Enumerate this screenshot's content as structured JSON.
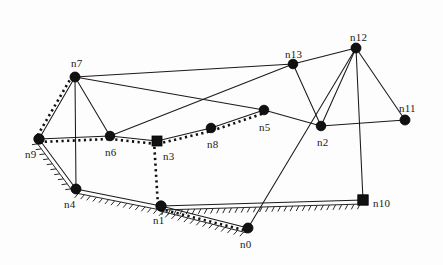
{
  "diagram": {
    "background_color": "#fdfdfd",
    "node_color": "#111111",
    "edge_color": "#1a1a1a",
    "width": 443,
    "height": 265
  },
  "nodes": [
    {
      "id": "n0",
      "label": "n0",
      "x": 248,
      "y": 228,
      "shape": "circle",
      "r": 5.0,
      "label_dx": -8,
      "label_dy": 11
    },
    {
      "id": "n1",
      "label": "n1",
      "x": 161,
      "y": 206,
      "shape": "circle",
      "r": 5.2,
      "label_dx": -8,
      "label_dy": 9
    },
    {
      "id": "n2",
      "label": "n2",
      "x": 321,
      "y": 126,
      "shape": "circle",
      "r": 4.8,
      "label_dx": -4,
      "label_dy": 11
    },
    {
      "id": "n3",
      "label": "n3",
      "x": 157,
      "y": 141,
      "shape": "square",
      "r": 5.0,
      "label_dx": 6,
      "label_dy": 10
    },
    {
      "id": "n4",
      "label": "n4",
      "x": 76,
      "y": 189,
      "shape": "circle",
      "r": 5.0,
      "label_dx": -12,
      "label_dy": 10
    },
    {
      "id": "n5",
      "label": "n5",
      "x": 264,
      "y": 110,
      "shape": "circle",
      "r": 4.8,
      "label_dx": -5,
      "label_dy": 12
    },
    {
      "id": "n6",
      "label": "n6",
      "x": 110,
      "y": 136,
      "shape": "circle",
      "r": 4.8,
      "label_dx": -5,
      "label_dy": 11
    },
    {
      "id": "n7",
      "label": "n7",
      "x": 75,
      "y": 77,
      "shape": "circle",
      "r": 5.0,
      "label_dx": -4,
      "label_dy": -19
    },
    {
      "id": "n8",
      "label": "n8",
      "x": 211,
      "y": 128,
      "shape": "circle",
      "r": 4.8,
      "label_dx": -4,
      "label_dy": 11
    },
    {
      "id": "n9",
      "label": "n9",
      "x": 39,
      "y": 139,
      "shape": "circle",
      "r": 5.2,
      "label_dx": -14,
      "label_dy": 10
    },
    {
      "id": "n10",
      "label": "n10",
      "x": 363,
      "y": 200,
      "shape": "square",
      "r": 5.2,
      "label_dx": 10,
      "label_dy": -2
    },
    {
      "id": "n11",
      "label": "n11",
      "x": 405,
      "y": 120,
      "shape": "circle",
      "r": 5.0,
      "label_dx": -6,
      "label_dy": -17
    },
    {
      "id": "n12",
      "label": "n12",
      "x": 356,
      "y": 48,
      "shape": "circle",
      "r": 5.0,
      "label_dx": -6,
      "label_dy": -16
    },
    {
      "id": "n13",
      "label": "n13",
      "x": 293,
      "y": 64,
      "shape": "circle",
      "r": 4.8,
      "label_dx": -8,
      "label_dy": -15
    }
  ],
  "edges": [
    {
      "from": "n7",
      "to": "n9",
      "style": "solid"
    },
    {
      "from": "n7",
      "to": "n6",
      "style": "solid"
    },
    {
      "from": "n7",
      "to": "n13",
      "style": "solid"
    },
    {
      "from": "n7",
      "to": "n5",
      "style": "solid"
    },
    {
      "from": "n9",
      "to": "n6",
      "style": "solid"
    },
    {
      "from": "n9",
      "to": "n4",
      "style": "solid"
    },
    {
      "from": "n6",
      "to": "n3",
      "style": "solid"
    },
    {
      "from": "n6",
      "to": "n13",
      "style": "solid"
    },
    {
      "from": "n3",
      "to": "n8",
      "style": "solid"
    },
    {
      "from": "n8",
      "to": "n5",
      "style": "solid"
    },
    {
      "from": "n5",
      "to": "n2",
      "style": "solid"
    },
    {
      "from": "n2",
      "to": "n11",
      "style": "solid"
    },
    {
      "from": "n2",
      "to": "n13",
      "style": "solid"
    },
    {
      "from": "n2",
      "to": "n12",
      "style": "solid"
    },
    {
      "from": "n12",
      "to": "n13",
      "style": "solid"
    },
    {
      "from": "n12",
      "to": "n11",
      "style": "solid"
    },
    {
      "from": "n12",
      "to": "n10",
      "style": "solid"
    },
    {
      "from": "n12",
      "to": "n0",
      "style": "solid"
    },
    {
      "from": "n4",
      "to": "n1",
      "style": "solid"
    },
    {
      "from": "n1",
      "to": "n10",
      "style": "solid"
    },
    {
      "from": "n1",
      "to": "n0",
      "style": "solid"
    },
    {
      "from": "n4",
      "to": "n7",
      "style": "solid"
    }
  ],
  "overlay_paths": [
    {
      "name": "dotted-path-a",
      "style": "dotted",
      "nodes": [
        "n7",
        "n9",
        "n6",
        "n3",
        "n8",
        "n5"
      ],
      "offset": 3
    },
    {
      "name": "dotted-path-b",
      "style": "dotted",
      "nodes": [
        "n3",
        "n1",
        "n0"
      ],
      "offset": 3
    },
    {
      "name": "hatched-path-a",
      "style": "hatched",
      "nodes": [
        "n9",
        "n4",
        "n1",
        "n10"
      ],
      "offset": 4
    },
    {
      "name": "hatched-path-b",
      "style": "hatched",
      "nodes": [
        "n1",
        "n0"
      ],
      "offset": 5
    }
  ],
  "chart_data": {
    "type": "diagram",
    "subtype": "node-link-graph",
    "node_count": 14,
    "edge_count": 22,
    "node_labels": [
      "n0",
      "n1",
      "n2",
      "n3",
      "n4",
      "n5",
      "n6",
      "n7",
      "n8",
      "n9",
      "n10",
      "n11",
      "n12",
      "n13"
    ],
    "square_nodes": [
      "n3",
      "n10"
    ],
    "edge_list": [
      "n7-n9",
      "n7-n6",
      "n7-n13",
      "n7-n5",
      "n9-n6",
      "n9-n4",
      "n6-n3",
      "n6-n13",
      "n3-n8",
      "n8-n5",
      "n5-n2",
      "n2-n11",
      "n2-n13",
      "n2-n12",
      "n12-n13",
      "n12-n11",
      "n12-n10",
      "n12-n0",
      "n4-n1",
      "n1-n10",
      "n1-n0",
      "n4-n7"
    ],
    "highlighted_paths": [
      {
        "name": "dotted",
        "nodes": [
          "n7",
          "n9",
          "n6",
          "n3",
          "n8",
          "n5"
        ]
      },
      {
        "name": "dotted",
        "nodes": [
          "n3",
          "n1",
          "n0"
        ]
      },
      {
        "name": "hatched",
        "nodes": [
          "n9",
          "n4",
          "n1",
          "n10"
        ]
      },
      {
        "name": "hatched",
        "nodes": [
          "n1",
          "n0"
        ]
      }
    ],
    "grid": false,
    "legend": "none"
  }
}
